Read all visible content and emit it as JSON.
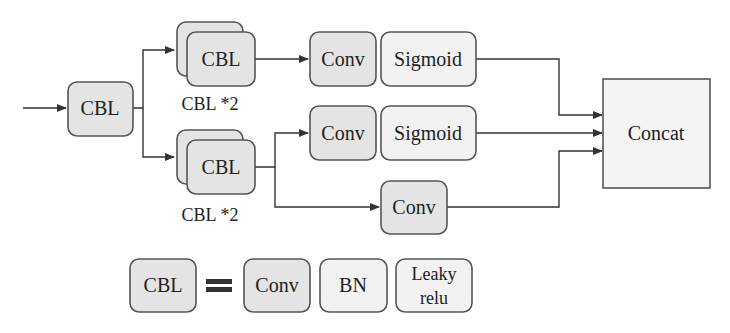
{
  "diagram": {
    "nodes": {
      "cbl_input": "CBL",
      "cbl_top": "CBL",
      "cbl_top_label": "CBL *2",
      "cbl_bottom": "CBL",
      "cbl_bottom_label": "CBL *2",
      "conv_top": "Conv",
      "sigmoid_top": "Sigmoid",
      "conv_mid": "Conv",
      "sigmoid_mid": "Sigmoid",
      "conv_bottom": "Conv",
      "concat": "Concat"
    },
    "legend": {
      "cbl": "CBL",
      "equals": "=",
      "conv": "Conv",
      "bn": "BN",
      "leaky_line1": "Leaky",
      "leaky_line2": "relu"
    }
  }
}
